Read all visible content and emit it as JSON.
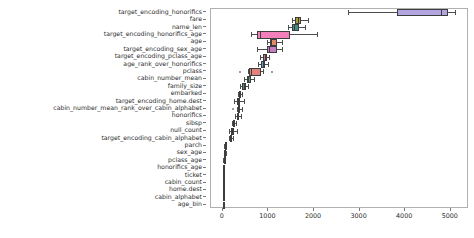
{
  "chart_data": {
    "type": "box",
    "title": "",
    "xlabel": "",
    "ylabel": "",
    "orientation": "horizontal",
    "xlim": [
      -260,
      5400
    ],
    "xticks": [
      0,
      1000,
      2000,
      3000,
      4000,
      5000
    ],
    "xticklabels": [
      "0",
      "1000",
      "2000",
      "3000",
      "4000",
      "5000"
    ],
    "grid": false,
    "legend": "none",
    "categories": [
      "target_encoding_honorifics",
      "fare",
      "name_len",
      "target_encoding_honorifics_age",
      "age",
      "target_encoding_sex_age",
      "target_encoding_pclass_age",
      "age_rank_over_honorifics",
      "pclass",
      "cabin_number_mean",
      "family_size",
      "embarked",
      "target_encoding_home.dest",
      "cabin_number_mean_rank_over_cabin_alphabet",
      "honorifics",
      "sibsp",
      "null_count",
      "target_encoding_cabin_alphabet",
      "parch",
      "sex_age",
      "pclass_age",
      "honorifics_age",
      "ticket",
      "cabin_count",
      "home.dest",
      "cabin_alphabet",
      "age_bin"
    ],
    "boxes": [
      {
        "label": "target_encoding_honorifics",
        "color": "#b3a6e0",
        "whislo": 2740,
        "q1": 3830,
        "med": 4780,
        "q3": 4940,
        "whishi": 5100,
        "fliers": []
      },
      {
        "label": "fare",
        "color": "#a99c3e",
        "whislo": 1520,
        "q1": 1580,
        "med": 1640,
        "q3": 1720,
        "whishi": 1860,
        "fliers": []
      },
      {
        "label": "name_len",
        "color": "#3f8f86",
        "whislo": 1420,
        "q1": 1510,
        "med": 1560,
        "q3": 1660,
        "whishi": 1810,
        "fliers": []
      },
      {
        "label": "target_encoding_honorifics_age",
        "color": "#f07fba",
        "whislo": 620,
        "q1": 740,
        "med": 810,
        "q3": 1480,
        "whishi": 2060,
        "fliers": []
      },
      {
        "label": "age",
        "color": "#e08a6b",
        "whislo": 960,
        "q1": 1040,
        "med": 1060,
        "q3": 1180,
        "whishi": 1300,
        "fliers": []
      },
      {
        "label": "target_encoding_sex_age",
        "color": "#c77fc4",
        "whislo": 760,
        "q1": 960,
        "med": 1020,
        "q3": 1180,
        "whishi": 1300,
        "fliers": []
      },
      {
        "label": "target_encoding_pclass_age",
        "color": "#e06a8e",
        "whislo": 820,
        "q1": 880,
        "med": 920,
        "q3": 960,
        "whishi": 1020,
        "fliers": []
      },
      {
        "label": "age_rank_over_honorifics",
        "color": "#6d9fd6",
        "whislo": 780,
        "q1": 840,
        "med": 880,
        "q3": 930,
        "whishi": 1000,
        "fliers": []
      },
      {
        "label": "pclass",
        "color": "#e0837c",
        "whislo": 560,
        "q1": 580,
        "med": 620,
        "q3": 840,
        "whishi": 880,
        "fliers": [
          380,
          1080
        ]
      },
      {
        "label": "cabin_number_mean",
        "color": "#4e9b7e",
        "whislo": 460,
        "q1": 520,
        "med": 560,
        "q3": 620,
        "whishi": 680,
        "fliers": []
      },
      {
        "label": "family_size",
        "color": "#4b8f82",
        "whislo": 380,
        "q1": 430,
        "med": 460,
        "q3": 500,
        "whishi": 560,
        "fliers": []
      },
      {
        "label": "embarked",
        "color": "#7a5a4a",
        "whislo": 330,
        "q1": 350,
        "med": 370,
        "q3": 390,
        "whishi": 410,
        "fliers": []
      },
      {
        "label": "target_encoding_home.dest",
        "color": "#d47fc6",
        "whislo": 250,
        "q1": 300,
        "med": 330,
        "q3": 380,
        "whishi": 470,
        "fliers": []
      },
      {
        "label": "cabin_number_mean_rank_over_cabin_alphabet",
        "color": "#e07fb0",
        "whislo": 300,
        "q1": 330,
        "med": 350,
        "q3": 380,
        "whishi": 420,
        "fliers": [
          220
        ]
      },
      {
        "label": "honorifics",
        "color": "#7ba87b",
        "whislo": 260,
        "q1": 300,
        "med": 330,
        "q3": 360,
        "whishi": 400,
        "fliers": []
      },
      {
        "label": "sibsp",
        "color": "#7a5f3c",
        "whislo": 200,
        "q1": 220,
        "med": 240,
        "q3": 260,
        "whishi": 290,
        "fliers": []
      },
      {
        "label": "null_count",
        "color": "#86a84e",
        "whislo": 140,
        "q1": 180,
        "med": 200,
        "q3": 240,
        "whishi": 300,
        "fliers": []
      },
      {
        "label": "target_encoding_cabin_alphabet",
        "color": "#9a94b4",
        "whislo": 130,
        "q1": 150,
        "med": 165,
        "q3": 185,
        "whishi": 215,
        "fliers": []
      },
      {
        "label": "parch",
        "color": "#6a5a4a",
        "whislo": 30,
        "q1": 40,
        "med": 45,
        "q3": 55,
        "whishi": 70,
        "fliers": []
      },
      {
        "label": "sex_age",
        "color": "#6a5a4a",
        "whislo": 20,
        "q1": 30,
        "med": 35,
        "q3": 45,
        "whishi": 60,
        "fliers": []
      },
      {
        "label": "pclass_age",
        "color": "#3a3a3a",
        "whislo": 10,
        "q1": 18,
        "med": 22,
        "q3": 30,
        "whishi": 40,
        "fliers": []
      },
      {
        "label": "honorifics_age",
        "color": "#6a5a4a",
        "whislo": 5,
        "q1": 12,
        "med": 16,
        "q3": 22,
        "whishi": 32,
        "fliers": []
      },
      {
        "label": "ticket",
        "color": "#6a5a4a",
        "whislo": 0,
        "q1": 5,
        "med": 8,
        "q3": 14,
        "whishi": 22,
        "fliers": []
      },
      {
        "label": "cabin_count",
        "color": "#6a5a4a",
        "whislo": 0,
        "q1": 2,
        "med": 4,
        "q3": 8,
        "whishi": 14,
        "fliers": []
      },
      {
        "label": "home.dest",
        "color": "#6a5a4a",
        "whislo": 0,
        "q1": 1,
        "med": 2,
        "q3": 5,
        "whishi": 10,
        "fliers": []
      },
      {
        "label": "cabin_alphabet",
        "color": "#6a5a4a",
        "whislo": 0,
        "q1": 0,
        "med": 1,
        "q3": 3,
        "whishi": 6,
        "fliers": []
      },
      {
        "label": "age_bin",
        "color": "#6a5a4a",
        "whislo": 0,
        "q1": 0,
        "med": 0,
        "q3": 1,
        "whishi": 3,
        "fliers": []
      }
    ]
  }
}
